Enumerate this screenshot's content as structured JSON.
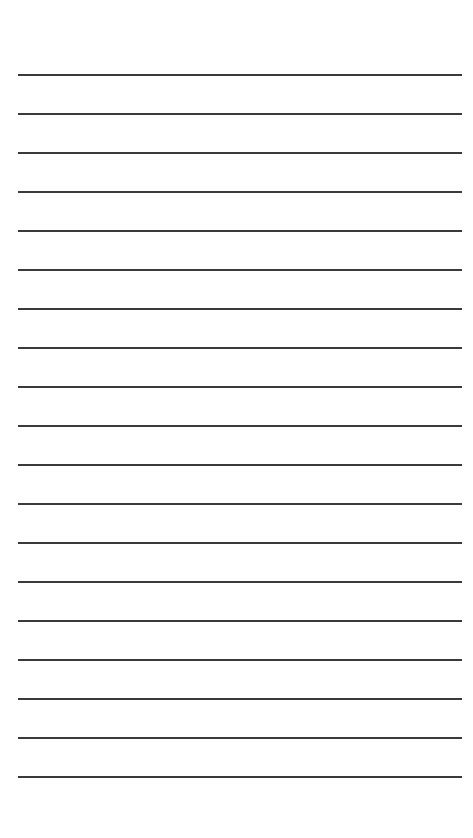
{
  "page": {
    "type": "ruled-paper",
    "background_color": "#ffffff",
    "line_color": "#3a3a3a",
    "line_count": 19,
    "line_left": 18,
    "line_right": 462,
    "line_thickness": 2,
    "lines_y": [
      75,
      114,
      153,
      192,
      231,
      270,
      309,
      348,
      387,
      426,
      465,
      504,
      543,
      582,
      621,
      660,
      699,
      738,
      777
    ]
  }
}
